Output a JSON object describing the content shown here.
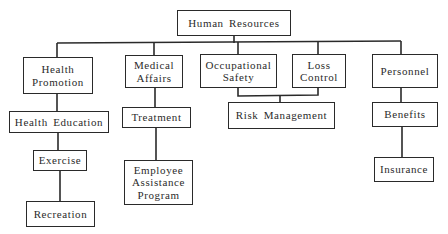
{
  "diagram": {
    "type": "org-chart",
    "root": {
      "id": "hr",
      "label": "Human Resources"
    },
    "nodes": [
      {
        "id": "hr",
        "lines": [
          "Human Resources"
        ]
      },
      {
        "id": "health_promotion",
        "lines": [
          "Health",
          "Promotion"
        ]
      },
      {
        "id": "medical_affairs",
        "lines": [
          "Medical",
          "Affairs"
        ]
      },
      {
        "id": "occupational_safety",
        "lines": [
          "Occupational",
          "Safety"
        ]
      },
      {
        "id": "loss_control",
        "lines": [
          "Loss",
          "Control"
        ]
      },
      {
        "id": "personnel",
        "lines": [
          "Personnel"
        ]
      },
      {
        "id": "health_education",
        "lines": [
          "Health Education"
        ]
      },
      {
        "id": "treatment",
        "lines": [
          "Treatment"
        ]
      },
      {
        "id": "risk_management",
        "lines": [
          "Risk Management"
        ]
      },
      {
        "id": "benefits",
        "lines": [
          "Benefits"
        ]
      },
      {
        "id": "exercise",
        "lines": [
          "Exercise"
        ]
      },
      {
        "id": "employee_assistance",
        "lines": [
          "Employee",
          "Assistance",
          "Program"
        ]
      },
      {
        "id": "insurance",
        "lines": [
          "Insurance"
        ]
      },
      {
        "id": "recreation",
        "lines": [
          "Recreation"
        ]
      }
    ],
    "edges": [
      [
        "hr",
        "health_promotion"
      ],
      [
        "hr",
        "medical_affairs"
      ],
      [
        "hr",
        "occupational_safety"
      ],
      [
        "hr",
        "loss_control"
      ],
      [
        "hr",
        "personnel"
      ],
      [
        "health_promotion",
        "health_education"
      ],
      [
        "health_education",
        "exercise"
      ],
      [
        "exercise",
        "recreation"
      ],
      [
        "medical_affairs",
        "treatment"
      ],
      [
        "treatment",
        "employee_assistance"
      ],
      [
        "occupational_safety",
        "risk_management"
      ],
      [
        "loss_control",
        "risk_management"
      ],
      [
        "personnel",
        "benefits"
      ],
      [
        "benefits",
        "insurance"
      ]
    ]
  },
  "labels": {
    "hr": {
      "l1": "Human Resources"
    },
    "health_promotion": {
      "l1": "Health",
      "l2": "Promotion"
    },
    "medical_affairs": {
      "l1": "Medical",
      "l2": "Affairs"
    },
    "occupational_safety": {
      "l1": "Occupational",
      "l2": "Safety"
    },
    "loss_control": {
      "l1": "Loss",
      "l2": "Control"
    },
    "personnel": {
      "l1": "Personnel"
    },
    "health_education": {
      "l1": "Health Education"
    },
    "treatment": {
      "l1": "Treatment"
    },
    "risk_management": {
      "l1": "Risk Management"
    },
    "benefits": {
      "l1": "Benefits"
    },
    "exercise": {
      "l1": "Exercise"
    },
    "employee_assistance": {
      "l1": "Employee",
      "l2": "Assistance",
      "l3": "Program"
    },
    "insurance": {
      "l1": "Insurance"
    },
    "recreation": {
      "l1": "Recreation"
    }
  }
}
